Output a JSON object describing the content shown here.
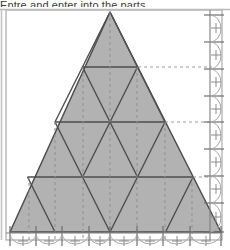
{
  "caption": {
    "text": "Entre and enter into the parts",
    "clipped": true
  },
  "figure": {
    "type": "geometric-diagram",
    "fill_color": "#b2b2b2",
    "stroke_color": "#4d4d4d",
    "frame_color": "#a8a8a8",
    "dash_color": "#9a9a9a",
    "axis_color": "#8c8c8c",
    "background": "#ffffff"
  },
  "frame": {
    "x": 6,
    "y": 10,
    "width": 216,
    "height": 230
  },
  "triangle": {
    "apex": {
      "x": 110,
      "y": 12
    },
    "bottom_left": {
      "x": 10,
      "y": 232
    },
    "bottom_right": {
      "x": 221,
      "y": 232
    },
    "subdivisions": 4,
    "small_triangle_count": 16
  },
  "rows": [
    {
      "index": 1,
      "upward": 1,
      "downward": 0,
      "y": 12
    },
    {
      "index": 2,
      "upward": 2,
      "downward": 1,
      "y": 67
    },
    {
      "index": 3,
      "upward": 3,
      "downward": 2,
      "y": 122
    },
    {
      "index": 4,
      "upward": 4,
      "downward": 3,
      "y": 177
    }
  ],
  "guides": {
    "horizontal_dashed": [
      {
        "label": "row-1-base",
        "y": 67
      },
      {
        "label": "row-2-base",
        "y": 122
      },
      {
        "label": "row-3-base",
        "y": 177
      }
    ],
    "vertical_dashed": [
      {
        "label": "v1",
        "x": 29
      },
      {
        "label": "v2",
        "x": 55
      },
      {
        "label": "v3",
        "x": 83
      },
      {
        "label": "v4",
        "x": 110
      },
      {
        "label": "v5",
        "x": 137
      },
      {
        "label": "v6",
        "x": 165
      },
      {
        "label": "v7",
        "x": 192
      }
    ]
  },
  "bottom_axis": {
    "name": "bottom-measure-axis",
    "y": 233,
    "tick_count": 9,
    "ticks": [
      10,
      36,
      62,
      89,
      110,
      137,
      163,
      190,
      221
    ],
    "arc_count": 8,
    "cross_marks": 8
  },
  "right_axis": {
    "name": "right-measure-axis",
    "x": 210,
    "tick_count": 9,
    "ticks": [
      15,
      42,
      69,
      96,
      122,
      149,
      176,
      203,
      232
    ],
    "arc_count": 8,
    "cross_marks": 8
  }
}
